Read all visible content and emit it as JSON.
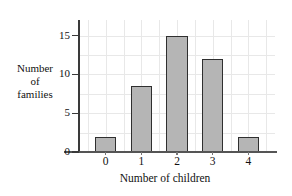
{
  "chart_data": {
    "type": "bar",
    "title": "",
    "xlabel": "Number of children",
    "ylabel": "Number of families",
    "ylabel_lines": [
      "Number",
      "of",
      "families"
    ],
    "categories": [
      "0",
      "1",
      "2",
      "3",
      "4"
    ],
    "values": [
      2,
      8.5,
      15,
      12,
      2
    ],
    "ytick_labels": [
      "0",
      "5",
      "10",
      "15"
    ],
    "ytick_values": [
      0,
      5,
      10,
      15
    ],
    "ylim": [
      0,
      17
    ],
    "xlim": [
      -0.75,
      4.75
    ],
    "grid": true,
    "legend": "none",
    "bar_fill_color": "#b5b5b5",
    "bar_edge_color": "#2f2f2f",
    "grid_color": "#e8e8e8",
    "axis_color": "#3a3a3a",
    "background_color": "#ffffff"
  }
}
